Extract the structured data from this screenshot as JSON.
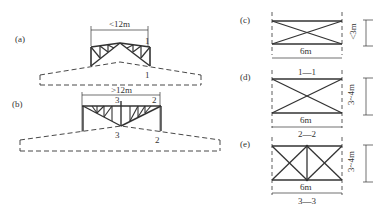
{
  "figure": {
    "panels": {
      "a": {
        "label": "(a)",
        "span": "<12m",
        "section_marks": [
          "1",
          "1"
        ]
      },
      "b": {
        "label": "(b)",
        "span": ">12m",
        "section_marks": [
          "3",
          "2",
          "3",
          "2"
        ]
      },
      "c": {
        "label": "(c)",
        "width": "6m",
        "height": "<3m",
        "section": "1—1"
      },
      "d": {
        "label": "(d)",
        "width": "6m",
        "height": "3~4m",
        "section": "2—2"
      },
      "e": {
        "label": "(e)",
        "width": "6m",
        "height": "3~4m",
        "section": "3—3"
      }
    },
    "colors": {
      "line": "#333333",
      "background": "#ffffff"
    }
  }
}
